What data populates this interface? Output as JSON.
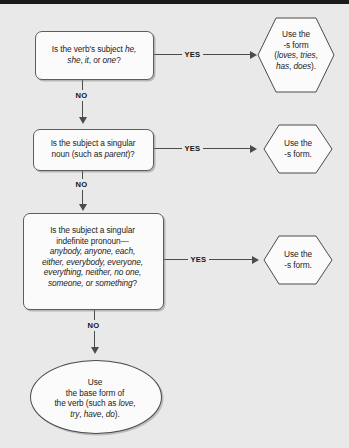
{
  "background_color": "#e9e9e9",
  "node_fill_color": "#fbfbfb",
  "line_color": "#4c4c4c",
  "edges": {
    "yes_1": "YES",
    "yes_2": "YES",
    "yes_3": "YES",
    "no_1": "NO",
    "no_2": "NO",
    "no_3": "NO"
  },
  "nodes": {
    "decision_1": {
      "shape": "rounded-rectangle",
      "line_1": "Is the verb's subject ",
      "line_1_italic": "he,",
      "line_2_italic_a": "she",
      "line_2_sep_a": ", ",
      "line_2_italic_b": "it",
      "line_2_sep_b": ", or ",
      "line_2_italic_c": "one",
      "line_2_end": "?"
    },
    "terminal_1": {
      "shape": "hexagon",
      "line_1": "Use the",
      "line_2": "-s form",
      "line_3_open": "(",
      "line_3_italic_a": "loves",
      "line_3_sep_a": ", ",
      "line_3_italic_b": "tries",
      "line_3_sep_b": ",",
      "line_4_italic_a": "has",
      "line_4_sep_a": ", ",
      "line_4_italic_b": "does",
      "line_4_close": ")."
    },
    "decision_2": {
      "shape": "rounded-rectangle",
      "line_1": "Is the subject a singular",
      "line_2_pre": "noun (such as ",
      "line_2_italic": "parent",
      "line_2_post": ")?"
    },
    "terminal_2": {
      "shape": "hexagon",
      "line_1": "Use the",
      "line_2": "-s form."
    },
    "decision_3": {
      "shape": "rounded-rectangle",
      "line_1": "Is the subject a singular",
      "line_2": "indefinite pronoun—",
      "line_3_italic": "anybody, anyone, each,",
      "line_4_italic": "either, everybody, everyone,",
      "line_5_italic": "everything, neither, no one,",
      "line_6_italic": "someone, or something",
      "line_6_end": "?"
    },
    "terminal_3": {
      "shape": "hexagon",
      "line_1": "Use the",
      "line_2": "-s form."
    },
    "terminal_4": {
      "shape": "oval",
      "line_1": "Use",
      "line_2": "the base form of",
      "line_3_pre": "the verb (such as ",
      "line_3_italic": "love,",
      "line_4_italic_a": "try",
      "line_4_sep_a": ", ",
      "line_4_italic_b": "have",
      "line_4_sep_b": ", ",
      "line_4_italic_c": "do",
      "line_4_close": ")."
    }
  }
}
